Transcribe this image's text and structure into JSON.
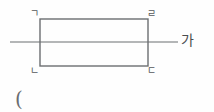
{
  "figure": {
    "type": "geometry-diagram",
    "background_color": "#fefefe",
    "stroke_color": "#6b6e71",
    "stroke_width": 1.2,
    "rectangle": {
      "name": "rectangle-gnd-r",
      "x": 40,
      "y": 19,
      "width": 108,
      "height": 47
    },
    "horizontal_line": {
      "name": "line-ga",
      "x1": 10,
      "y1": 42,
      "x2": 178,
      "y2": 42
    },
    "vertex_labels": [
      {
        "id": "label-g",
        "text": "ㄱ",
        "corner": "top-left"
      },
      {
        "id": "label-r",
        "text": "ㄹ",
        "corner": "top-right"
      },
      {
        "id": "label-n",
        "text": "ㄴ",
        "corner": "bottom-left"
      },
      {
        "id": "label-d",
        "text": "ㄷ",
        "corner": "bottom-right"
      }
    ],
    "line_label": {
      "id": "label-ga",
      "text": "가"
    },
    "paren_mark": {
      "id": "paren",
      "text": "("
    },
    "label_color": "#56595c",
    "line_label_color": "#4a4d50"
  }
}
